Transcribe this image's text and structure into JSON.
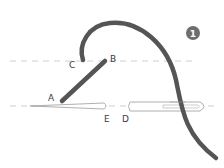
{
  "diagram": {
    "step_badge": "1",
    "labels": {
      "a": "A",
      "b": "B",
      "c": "C",
      "d": "D",
      "e": "E"
    },
    "colors": {
      "thread": "#555555",
      "guide_line": "#cfcfcf",
      "needle_outline": "#9a9a9a",
      "badge": "#6e6e6e",
      "label": "#3a3a3a"
    }
  }
}
